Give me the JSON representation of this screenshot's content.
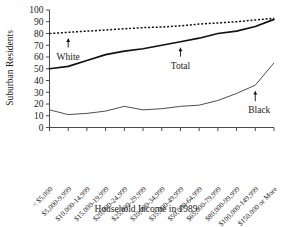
{
  "chart_data": {
    "type": "line",
    "title": "",
    "xlabel": "Household Income in 1989",
    "ylabel": "Suburban Residents",
    "ylim": [
      0,
      100
    ],
    "yticks": [
      0,
      10,
      20,
      30,
      40,
      50,
      60,
      70,
      80,
      90,
      100
    ],
    "grid": false,
    "legend_position": "inline-annotations",
    "categories": [
      "< $5,000",
      "$5,000-9,999",
      "$10,000-14,999",
      "$15,000-19,999",
      "$20,000-24,999",
      "$25,000-29,999",
      "$30,000-34,999",
      "$35,000-49,999",
      "$50,000-64,999",
      "$65,000-79,999",
      "$80,000-99,999",
      "$100,000-149,999",
      "$150,000 or More"
    ],
    "series": [
      {
        "name": "White",
        "style": "dotted",
        "values": [
          80,
          81,
          82,
          83,
          84,
          85,
          85.5,
          86.5,
          88,
          89,
          90,
          91.5,
          93
        ]
      },
      {
        "name": "Total",
        "style": "solid-thick",
        "values": [
          50,
          52,
          57,
          62,
          65,
          67,
          70,
          73,
          76,
          80,
          82,
          86,
          92
        ]
      },
      {
        "name": "Black",
        "style": "solid-thin",
        "values": [
          15,
          11,
          12,
          14,
          18,
          15,
          16,
          18,
          19,
          23,
          29,
          36,
          55
        ]
      }
    ],
    "annotations": [
      {
        "label": "White",
        "category_index": 1,
        "value": 80
      },
      {
        "label": "Total",
        "category_index": 7,
        "value": 73
      },
      {
        "label": "Black",
        "category_index": 11,
        "value": 36
      }
    ]
  }
}
